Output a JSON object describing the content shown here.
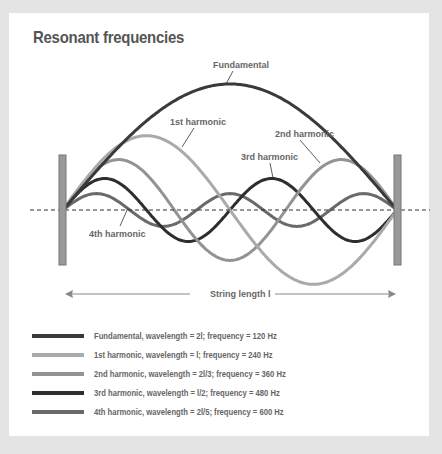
{
  "title": "Resonant frequencies",
  "axis": {
    "label": "String length l",
    "left_arrow_icon": "arrow-left-icon",
    "right_arrow_icon": "arrow-right-icon"
  },
  "labels": {
    "fundamental": "Fundamental",
    "h1": "1st harmonic",
    "h2": "2nd harmonic",
    "h3": "3rd harmonic",
    "h4": "4th harmonic"
  },
  "legend": [
    {
      "text": "Fundamental, wavelength = 2l; frequency = 120 Hz",
      "color": "#3a3a3a"
    },
    {
      "text": "1st harmonic, wavelength = l; frequency = 240 Hz",
      "color": "#aaaaaa"
    },
    {
      "text": "2nd harmonic, wavelength = 2l/3; frequency = 360 Hz",
      "color": "#939393"
    },
    {
      "text": "3rd harmonic, wavelength = l/2; frequency = 480 Hz",
      "color": "#2e2e2e"
    },
    {
      "text": "4th harmonic, wavelength = 2l/5; frequency = 600 Hz",
      "color": "#6a6a6a"
    }
  ],
  "chart_data": {
    "type": "line",
    "title": "Resonant frequencies",
    "xlabel": "String length l",
    "ylabel": "",
    "x_range": [
      0,
      1
    ],
    "series": [
      {
        "name": "Fundamental",
        "half_waves": 1,
        "amplitude": 1.0,
        "wavelength": "2l",
        "frequency_hz": 120,
        "color": "#3a3a3a"
      },
      {
        "name": "1st harmonic",
        "half_waves": 2,
        "amplitude": 0.59,
        "wavelength": "l",
        "frequency_hz": 240,
        "color": "#aaaaaa"
      },
      {
        "name": "2nd harmonic",
        "half_waves": 3,
        "amplitude": 0.4,
        "wavelength": "2l/3",
        "frequency_hz": 360,
        "color": "#939393"
      },
      {
        "name": "3rd harmonic",
        "half_waves": 4,
        "amplitude": 0.25,
        "wavelength": "l/2",
        "frequency_hz": 480,
        "color": "#2e2e2e"
      },
      {
        "name": "4th harmonic",
        "half_waves": 5,
        "amplitude": 0.13,
        "wavelength": "2l/5",
        "frequency_hz": 600,
        "color": "#6a6a6a"
      }
    ],
    "grid": false,
    "legend_position": "bottom"
  }
}
